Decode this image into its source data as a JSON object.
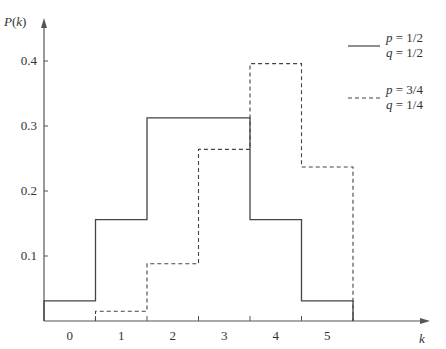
{
  "chart_data": {
    "type": "line",
    "subtype": "step",
    "title": "",
    "xlabel": "k",
    "ylabel": "P(k)",
    "x": [
      0,
      1,
      2,
      3,
      4,
      5
    ],
    "categories": [
      "0",
      "1",
      "2",
      "3",
      "4",
      "5"
    ],
    "yticks": [
      "0.1",
      "0.2",
      "0.3",
      "0.4"
    ],
    "ylim": [
      0,
      0.45
    ],
    "grid": false,
    "legend_position": "top-right",
    "series": [
      {
        "name": "p = 1/2, q = 1/2",
        "style": "solid",
        "values": [
          0.031,
          0.156,
          0.3125,
          0.3125,
          0.156,
          0.031
        ]
      },
      {
        "name": "p = 3/4, q = 1/4",
        "style": "dashed",
        "values": [
          0.001,
          0.015,
          0.088,
          0.264,
          0.396,
          0.237
        ]
      }
    ]
  },
  "legend": [
    {
      "line1": "p = 1/2",
      "line2": "q = 1/2",
      "style": "solid"
    },
    {
      "line1": "p = 3/4",
      "line2": "q = 1/4",
      "style": "dashed"
    }
  ]
}
